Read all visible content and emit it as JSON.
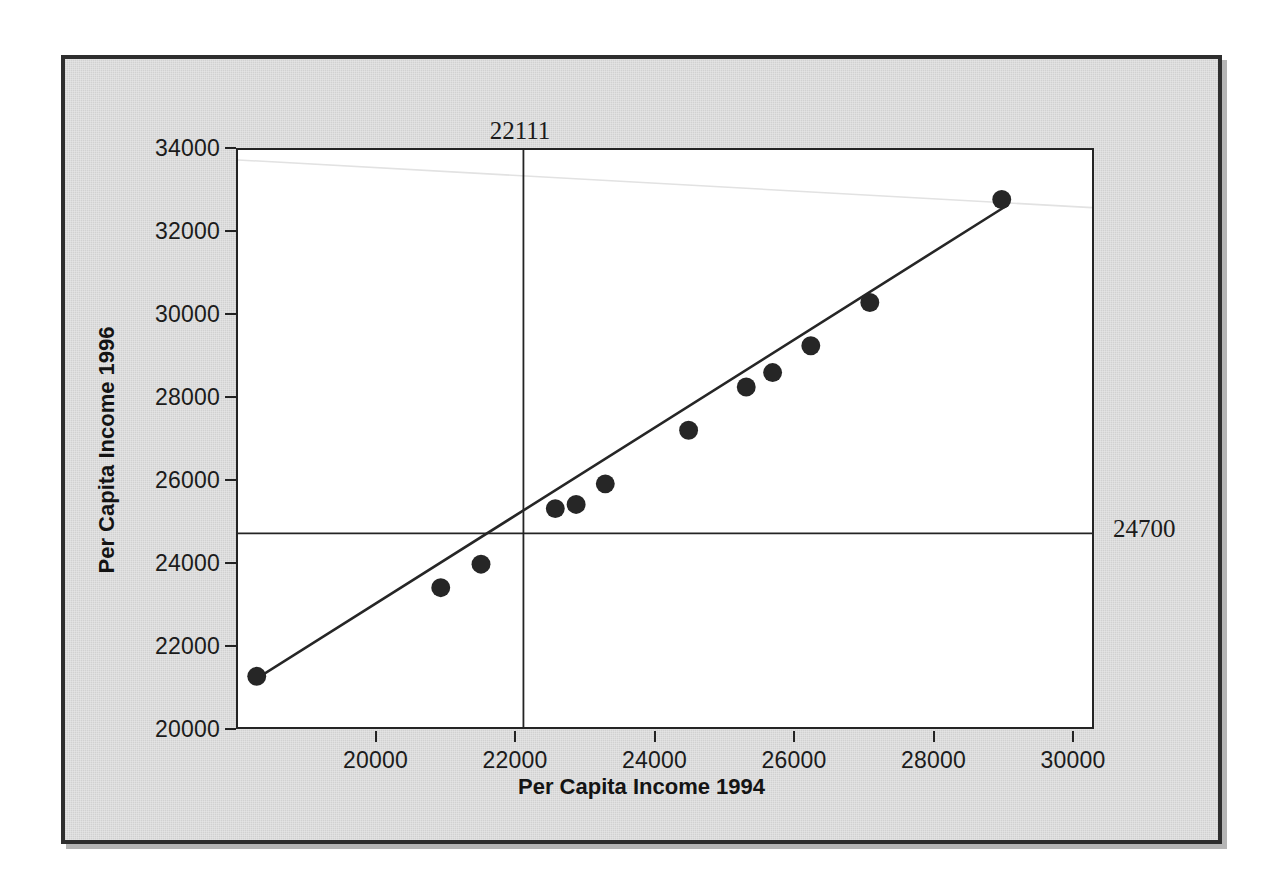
{
  "chart_data": {
    "type": "scatter",
    "title": "",
    "xlabel": "Per Capita Income 1994",
    "ylabel": "Per Capita Income 1996",
    "xlim": [
      18000,
      30300
    ],
    "ylim": [
      20000,
      34000
    ],
    "xticks": [
      "20000",
      "22000",
      "24000",
      "26000",
      "28000",
      "30000"
    ],
    "xtick_values": [
      20000,
      22000,
      24000,
      26000,
      28000,
      30000
    ],
    "yticks": [
      "20000",
      "22000",
      "24000",
      "26000",
      "28000",
      "30000",
      "32000",
      "34000"
    ],
    "ytick_values": [
      20000,
      22000,
      24000,
      26000,
      28000,
      30000,
      32000,
      34000
    ],
    "grid": false,
    "legend": "none",
    "marker": "filled-circle",
    "marker_color": "#262626",
    "line_color": "#262626",
    "points": [
      {
        "x": 18270,
        "y": 21230
      },
      {
        "x": 20920,
        "y": 23380
      },
      {
        "x": 21500,
        "y": 23950
      },
      {
        "x": 22570,
        "y": 25300
      },
      {
        "x": 22870,
        "y": 25400
      },
      {
        "x": 23290,
        "y": 25900
      },
      {
        "x": 24490,
        "y": 27200
      },
      {
        "x": 25320,
        "y": 28250
      },
      {
        "x": 25700,
        "y": 28600
      },
      {
        "x": 26250,
        "y": 29250
      },
      {
        "x": 27100,
        "y": 30300
      },
      {
        "x": 29000,
        "y": 32800
      }
    ],
    "fit_line": {
      "name": "fitted-line",
      "from": {
        "x": 18200,
        "y": 21100
      },
      "to": {
        "x": 29080,
        "y": 32660
      }
    },
    "annotations": [
      {
        "name": "vertical-reference-line",
        "orientation": "vertical",
        "value": 22111,
        "label": "22111",
        "label_position": "above-plot"
      },
      {
        "name": "horizontal-reference-line",
        "orientation": "horizontal",
        "value": 24700,
        "label": "24700",
        "label_position": "right-of-plot"
      }
    ]
  },
  "panel": {
    "background_color": "#d6d6d6",
    "border_color": "#2e2e2e",
    "plot_background_color": "#ffffff"
  },
  "ghost_text": [
    {
      "text": "Per Capita Income",
      "x": 120,
      "y": 118,
      "size": 27
    },
    {
      "text": "s. The inflection from the Parking   on the rain",
      "x": 205,
      "y": 265,
      "size": 26
    },
    {
      "text": "ytables;",
      "x": 95,
      "y": 305,
      "size": 26
    },
    {
      "text": "variables",
      "x": 760,
      "y": 305,
      "size": 26
    },
    {
      "text": "Income",
      "x": 880,
      "y": 455,
      "size": 26
    },
    {
      "text": "7941",
      "x": 320,
      "y": 660,
      "size": 30
    },
    {
      "text": "Total = 50",
      "x": 540,
      "y": 660,
      "size": 30
    }
  ]
}
